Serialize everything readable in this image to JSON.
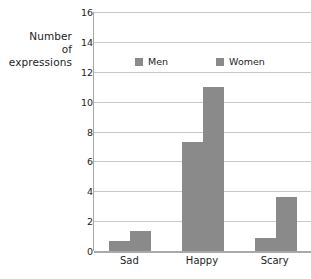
{
  "chart_data": {
    "type": "bar",
    "title": "",
    "xlabel": "",
    "ylabel": "Number of expressions",
    "ylabel_lines": [
      "Number",
      "of",
      "expressions"
    ],
    "categories": [
      "Sad",
      "Happy",
      "Scary"
    ],
    "series": [
      {
        "name": "Men",
        "values": [
          0.7,
          7.3,
          0.85
        ],
        "color": "#8a8a8a"
      },
      {
        "name": "Women",
        "values": [
          1.35,
          11.0,
          3.6
        ],
        "color": "#8a8a8a"
      }
    ],
    "ylim": [
      0,
      16
    ],
    "yticks": [
      0,
      2,
      4,
      6,
      8,
      10,
      12,
      14,
      16
    ],
    "ytick_labels": [
      "0",
      "2",
      "4",
      "6",
      "8",
      "10",
      "12",
      "14",
      "16"
    ],
    "grid": true,
    "grid_axis": "y",
    "legend": {
      "position": "upper-center-inside",
      "entries": [
        "Men",
        "Women"
      ]
    },
    "colors": {
      "bar": "#8a8a8a",
      "grid": "#c9c9c9",
      "axis": "#a9a9a9",
      "text": "#1d1d1d",
      "background": "#ffffff"
    }
  }
}
